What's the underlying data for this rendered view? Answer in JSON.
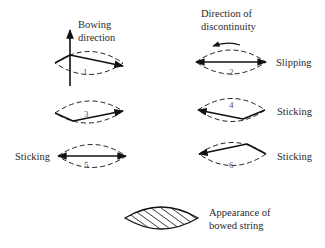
{
  "labels": {
    "bowing_direction": [
      "Bowing",
      "direction"
    ],
    "direction_of_discontinuity": [
      "Direction of",
      "discontinuity"
    ],
    "appearance": [
      "Appearance of",
      "bowed string"
    ]
  },
  "frames": [
    {
      "number": "1",
      "state": ""
    },
    {
      "number": "2",
      "state": "Slipping"
    },
    {
      "number": "3",
      "state": ""
    },
    {
      "number": "4",
      "state": "Sticking"
    },
    {
      "number": "5",
      "state": "Sticking"
    },
    {
      "number": "6",
      "state": "Sticking"
    }
  ]
}
